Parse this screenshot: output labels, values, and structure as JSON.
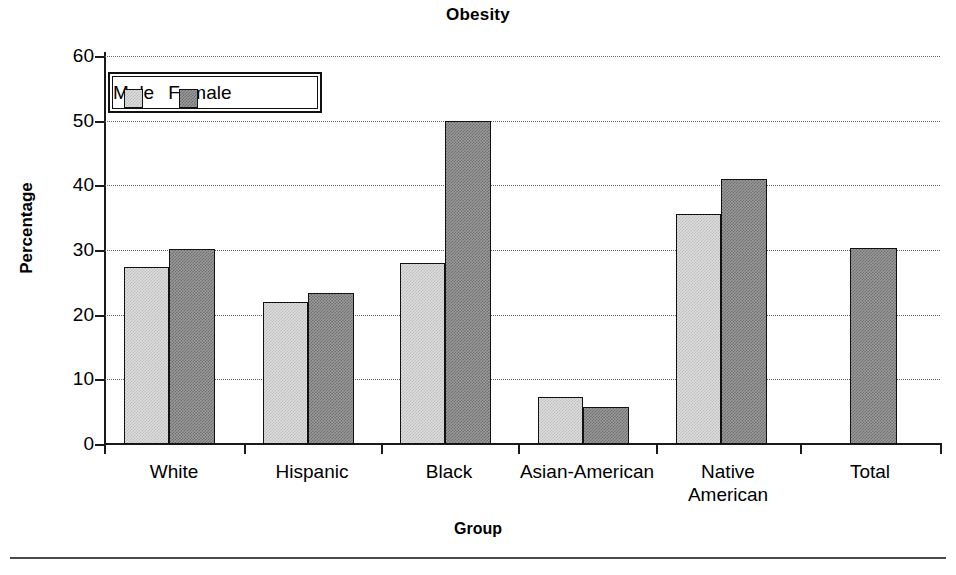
{
  "chart_data": {
    "type": "bar",
    "title": "Obesity",
    "xlabel": "Group",
    "ylabel": "Percentage",
    "categories": [
      "White",
      "Hispanic",
      "Black",
      "Asian-American",
      "Native American",
      "Total"
    ],
    "series": [
      {
        "name": "Male",
        "values": [
          27.3,
          21.9,
          28.0,
          7.2,
          35.5,
          null
        ]
      },
      {
        "name": "Female",
        "values": [
          30.2,
          23.4,
          50.0,
          5.8,
          41.0,
          30.3
        ]
      }
    ],
    "ylim": [
      0,
      60
    ],
    "yticks": [
      0,
      10,
      20,
      30,
      40,
      50,
      60
    ],
    "ytick_labels": [
      "0",
      "10",
      "20",
      "30",
      "40",
      "50",
      "60"
    ],
    "grid": true,
    "grid_axis": "y",
    "grid_style": "dotted",
    "legend_position": "upper-left-inside",
    "legend_entries": [
      "Male",
      "Female"
    ],
    "colors": {
      "male": "#dedede",
      "female": "#9a9a9a",
      "bar_edge": "#111111",
      "axis": "#1a1a1a",
      "grid": "#666666",
      "text": "#000000",
      "background": "#ffffff"
    }
  },
  "axis": {
    "title": "Obesity",
    "xlabel": "Group",
    "ylabel": "Percentage"
  },
  "legend": {
    "male_label": "Male",
    "female_label": "Female"
  },
  "yticks": [
    {
      "label": "60",
      "value": 60
    },
    {
      "label": "50",
      "value": 50
    },
    {
      "label": "40",
      "value": 40
    },
    {
      "label": "30",
      "value": 30
    },
    {
      "label": "20",
      "value": 20
    },
    {
      "label": "10",
      "value": 10
    },
    {
      "label": "0",
      "value": 0
    }
  ],
  "categories": [
    {
      "label": "White",
      "line1": "White",
      "line2": ""
    },
    {
      "label": "Hispanic",
      "line1": "Hispanic",
      "line2": ""
    },
    {
      "label": "Black",
      "line1": "Black",
      "line2": ""
    },
    {
      "label": "Asian-American",
      "line1": "Asian-American",
      "line2": ""
    },
    {
      "label": "Native American",
      "line1": "Native",
      "line2": "American"
    },
    {
      "label": "Total",
      "line1": "Total",
      "line2": ""
    }
  ],
  "bars": [
    {
      "group": "White",
      "series": "Male",
      "value": 27.3,
      "x": 20,
      "w": 45
    },
    {
      "group": "White",
      "series": "Female",
      "value": 30.2,
      "x": 65,
      "w": 46
    },
    {
      "group": "Hispanic",
      "series": "Male",
      "value": 21.9,
      "x": 159,
      "w": 45
    },
    {
      "group": "Hispanic",
      "series": "Female",
      "value": 23.4,
      "x": 204,
      "w": 46
    },
    {
      "group": "Black",
      "series": "Male",
      "value": 28.0,
      "x": 296,
      "w": 45
    },
    {
      "group": "Black",
      "series": "Female",
      "value": 50.0,
      "x": 341,
      "w": 46
    },
    {
      "group": "Asian-American",
      "series": "Male",
      "value": 7.2,
      "x": 434,
      "w": 45
    },
    {
      "group": "Asian-American",
      "series": "Female",
      "value": 5.8,
      "x": 479,
      "w": 46
    },
    {
      "group": "Native American",
      "series": "Male",
      "value": 35.5,
      "x": 572,
      "w": 45
    },
    {
      "group": "Native American",
      "series": "Female",
      "value": 41.0,
      "x": 617,
      "w": 46
    },
    {
      "group": "Total",
      "series": "Female",
      "value": 30.3,
      "x": 746,
      "w": 47
    }
  ]
}
